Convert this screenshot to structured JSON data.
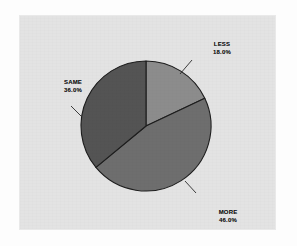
{
  "figure": {
    "panel_background": "#e3e3e3",
    "page_background": "#fdfdfd",
    "outline_color": "#1d1d1d"
  },
  "chart_data": {
    "type": "pie",
    "title": "",
    "subtitle": "",
    "xlabel": "",
    "ylabel": "",
    "grid": false,
    "legend_position": "none",
    "labels_on_slices": true,
    "start_angle_deg": 0,
    "direction": "clockwise",
    "categories": [
      "LESS",
      "MORE",
      "SAME"
    ],
    "values": [
      18.0,
      46.0,
      36.0
    ],
    "value_labels": [
      "18.0%",
      "46.0%",
      "36.0%"
    ],
    "colors": [
      "#8c8c8c",
      "#6e6e6e",
      "#545454"
    ],
    "slices": [
      {
        "name": "LESS",
        "value": 18.0,
        "value_label": "18.0%",
        "color": "#8c8c8c",
        "start_deg": 0,
        "end_deg": 64.8
      },
      {
        "name": "MORE",
        "value": 46.0,
        "value_label": "46.0%",
        "color": "#6e6e6e",
        "start_deg": 64.8,
        "end_deg": 230.4
      },
      {
        "name": "SAME",
        "value": 36.0,
        "value_label": "36.0%",
        "color": "#545454",
        "start_deg": 230.4,
        "end_deg": 360
      }
    ]
  },
  "labels": {
    "less": {
      "name": "LESS",
      "value": "18.0%"
    },
    "more": {
      "name": "MORE",
      "value": "46.0%"
    },
    "same": {
      "name": "SAME",
      "value": "36.0%"
    }
  }
}
